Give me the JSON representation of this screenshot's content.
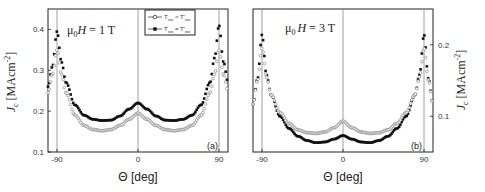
{
  "chart_data": [
    {
      "type": "scatter",
      "panel_label": "(a)",
      "annotation": "μ0H = 1 T",
      "annotation_parts": {
        "mu": "μ",
        "sub": "0",
        "h": "H",
        "rest": " = 1 T"
      },
      "xlabel": "Θ [deg]",
      "ylabel": "Jc [MAcm⁻²]",
      "ylabel_parts": {
        "j": "J",
        "sub": "c",
        "unit": " [MAcm",
        "sup": "-2",
        "close": "]"
      },
      "xlim": [
        -100,
        100
      ],
      "ylim": [
        0.1,
        0.45
      ],
      "xticks": [
        -90,
        0,
        90
      ],
      "yticks": [
        0.1,
        0.2,
        0.3,
        0.4
      ],
      "ytick_labels": [
        "0.1",
        "0.2",
        "0.3",
        "0.4"
      ],
      "xtick_labels": [
        "-90",
        "0",
        "90"
      ],
      "yaxis_side": "left",
      "vertical_lines": [
        -90,
        0,
        90
      ],
      "grid": false,
      "legend": {
        "position": "top-right",
        "entries": [
          {
            "marker": "open-circle",
            "label": "T_sro < T'_sro",
            "t": "T",
            "s1": "sro",
            "op": " < ",
            "t2": "T'",
            "s2": "sro"
          },
          {
            "marker": "filled-square",
            "label": "T_sro = T'_sro",
            "t": "T",
            "s1": "sro",
            "op": " = ",
            "t2": "T'",
            "s2": "sro"
          }
        ]
      },
      "series": [
        {
          "name": "T_sro < T'_sro",
          "marker": "open-circle",
          "x": [
            -100,
            -95,
            -90,
            -85,
            -80,
            -70,
            -60,
            -50,
            -40,
            -30,
            -20,
            -10,
            0,
            10,
            20,
            30,
            40,
            50,
            60,
            70,
            80,
            85,
            90,
            95,
            100
          ],
          "y": [
            0.245,
            0.29,
            0.35,
            0.29,
            0.245,
            0.19,
            0.165,
            0.155,
            0.152,
            0.155,
            0.165,
            0.18,
            0.195,
            0.18,
            0.165,
            0.155,
            0.152,
            0.155,
            0.165,
            0.19,
            0.245,
            0.29,
            0.35,
            0.29,
            0.25
          ]
        },
        {
          "name": "T_sro = T'_sro",
          "marker": "filled-square",
          "x": [
            -100,
            -95,
            -90,
            -85,
            -80,
            -70,
            -60,
            -50,
            -40,
            -30,
            -20,
            -10,
            0,
            10,
            20,
            30,
            40,
            50,
            60,
            70,
            80,
            85,
            90,
            95,
            100
          ],
          "y": [
            0.26,
            0.31,
            0.395,
            0.32,
            0.27,
            0.215,
            0.19,
            0.18,
            0.177,
            0.178,
            0.188,
            0.205,
            0.22,
            0.205,
            0.188,
            0.178,
            0.177,
            0.18,
            0.19,
            0.215,
            0.27,
            0.33,
            0.41,
            0.32,
            0.27
          ]
        }
      ]
    },
    {
      "type": "scatter",
      "panel_label": "(b)",
      "annotation": "μ0H = 3 T",
      "annotation_parts": {
        "mu": "μ",
        "sub": "0",
        "h": "H",
        "rest": " = 3 T"
      },
      "xlabel": "Θ [deg]",
      "ylabel": "Jc [MAcm⁻²]",
      "ylabel_parts": {
        "j": "J",
        "sub": "c",
        "unit": " [MAcm",
        "sup": "-2",
        "close": "]"
      },
      "xlim": [
        -100,
        100
      ],
      "ylim": [
        0.05,
        0.25
      ],
      "xticks": [
        -90,
        0,
        90
      ],
      "yticks": [
        0.1,
        0.2
      ],
      "ytick_labels": [
        "0.1",
        "0.2"
      ],
      "xtick_labels": [
        "-90",
        "0",
        "90"
      ],
      "yaxis_side": "right",
      "vertical_lines": [
        -90,
        0,
        90
      ],
      "grid": false,
      "series": [
        {
          "name": "T_sro < T'_sro",
          "marker": "open-circle",
          "x": [
            -100,
            -95,
            -90,
            -85,
            -80,
            -70,
            -60,
            -50,
            -40,
            -30,
            -20,
            -10,
            0,
            10,
            20,
            30,
            40,
            50,
            60,
            70,
            80,
            85,
            90,
            95,
            100
          ],
          "y": [
            0.117,
            0.15,
            0.195,
            0.155,
            0.13,
            0.105,
            0.09,
            0.081,
            0.077,
            0.076,
            0.078,
            0.084,
            0.093,
            0.084,
            0.078,
            0.076,
            0.077,
            0.081,
            0.09,
            0.105,
            0.13,
            0.155,
            0.195,
            0.15,
            0.117
          ]
        },
        {
          "name": "T_sro = T'_sro",
          "marker": "filled-square",
          "x": [
            -100,
            -95,
            -90,
            -85,
            -80,
            -70,
            -60,
            -50,
            -40,
            -30,
            -20,
            -10,
            0,
            10,
            20,
            30,
            40,
            50,
            60,
            70,
            80,
            85,
            90,
            95,
            100
          ],
          "y": [
            0.117,
            0.152,
            0.214,
            0.158,
            0.13,
            0.1,
            0.083,
            0.072,
            0.066,
            0.063,
            0.064,
            0.068,
            0.073,
            0.068,
            0.064,
            0.063,
            0.066,
            0.072,
            0.083,
            0.1,
            0.13,
            0.158,
            0.214,
            0.152,
            0.117
          ]
        }
      ]
    }
  ]
}
